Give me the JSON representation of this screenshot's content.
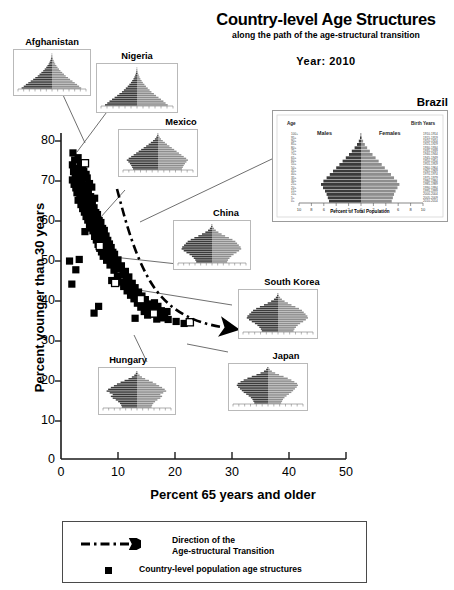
{
  "header": {
    "title": "Country-level Age Structures",
    "subtitle": "along the path of the age-structural transition",
    "year_label": "Year:  2010"
  },
  "axes": {
    "xlabel": "Percent 65 years and older",
    "ylabel": "Percent younger than 30 years",
    "xticks": [
      "0",
      "10",
      "20",
      "30",
      "40",
      "50"
    ],
    "yticks": [
      "0",
      "10",
      "20",
      "30",
      "40",
      "50",
      "60",
      "70",
      "80"
    ]
  },
  "legend": {
    "arrow_line1": "Direction of the",
    "arrow_line2": "Age-structural Transition",
    "marker_label": "Country-level population age structures"
  },
  "insets": {
    "afghanistan": {
      "caption": "Afghanistan"
    },
    "nigeria": {
      "caption": "Nigeria"
    },
    "mexico": {
      "caption": "Mexico"
    },
    "china": {
      "caption": "China"
    },
    "south_korea": {
      "caption": "South Korea"
    },
    "japan": {
      "caption": "Japan"
    },
    "hungary": {
      "caption": "Hungary"
    },
    "brazil": {
      "caption": "Brazil",
      "males_label": "Males",
      "females_label": "Females",
      "xlabel": "Percent of Total Population",
      "left_header": "Age",
      "right_header": "Birth Years"
    }
  },
  "colors": {
    "marker": "#000000",
    "highlight_marker": "#ffffff",
    "axis": "#1a1a1a",
    "inset_border": "#b9b9b9",
    "pyramid_male": "#3b3b3b",
    "pyramid_female": "#8e8e8e"
  },
  "chart_data": {
    "type": "scatter",
    "title": "Country-level Age Structures",
    "subtitle": "along the path of the age-structural transition",
    "xlabel": "Percent 65 years and older",
    "ylabel": "Percent younger than 30 years",
    "xlim": [
      0,
      50
    ],
    "ylim": [
      0,
      80
    ],
    "xticks": [
      0,
      10,
      20,
      30,
      40,
      50
    ],
    "yticks": [
      0,
      10,
      20,
      30,
      40,
      50,
      60,
      70,
      80
    ],
    "grid": false,
    "legend_position": "below-axes",
    "annotation": "Dash-dot arrow indicates direction of the age-structural transition, sweeping from high-youth/low-aged (upper left) toward low-youth/high-aged (lower right).",
    "series": [
      {
        "name": "Country-level population age structures",
        "marker": "filled-square",
        "points": [
          [
            2.1,
            77.0
          ],
          [
            2.4,
            75.2
          ],
          [
            3.0,
            75.8
          ],
          [
            2.0,
            74.0
          ],
          [
            3.4,
            74.3
          ],
          [
            2.7,
            73.2
          ],
          [
            3.8,
            73.5
          ],
          [
            2.2,
            72.3
          ],
          [
            3.1,
            72.0
          ],
          [
            4.0,
            72.4
          ],
          [
            2.5,
            71.1
          ],
          [
            3.5,
            71.3
          ],
          [
            4.4,
            71.6
          ],
          [
            2.0,
            70.2
          ],
          [
            2.9,
            70.4
          ],
          [
            3.7,
            70.0
          ],
          [
            4.6,
            70.7
          ],
          [
            2.3,
            69.1
          ],
          [
            3.2,
            69.4
          ],
          [
            4.1,
            69.0
          ],
          [
            5.0,
            69.3
          ],
          [
            2.6,
            68.2
          ],
          [
            3.6,
            68.5
          ],
          [
            4.5,
            68.1
          ],
          [
            5.4,
            68.4
          ],
          [
            2.8,
            67.0
          ],
          [
            3.9,
            67.3
          ],
          [
            4.8,
            67.0
          ],
          [
            3.3,
            66.2
          ],
          [
            4.3,
            66.5
          ],
          [
            5.2,
            66.0
          ],
          [
            3.0,
            65.1
          ],
          [
            4.0,
            65.4
          ],
          [
            5.0,
            65.2
          ],
          [
            5.9,
            65.6
          ],
          [
            3.5,
            64.0
          ],
          [
            4.5,
            64.3
          ],
          [
            5.5,
            64.1
          ],
          [
            3.8,
            63.0
          ],
          [
            4.8,
            63.4
          ],
          [
            5.8,
            63.2
          ],
          [
            4.1,
            62.1
          ],
          [
            5.1,
            62.4
          ],
          [
            6.1,
            62.0
          ],
          [
            4.4,
            61.0
          ],
          [
            5.4,
            61.3
          ],
          [
            6.4,
            61.5
          ],
          [
            4.7,
            60.1
          ],
          [
            5.7,
            60.4
          ],
          [
            6.7,
            60.0
          ],
          [
            5.0,
            59.0
          ],
          [
            6.0,
            59.3
          ],
          [
            7.0,
            59.5
          ],
          [
            5.3,
            58.1
          ],
          [
            6.3,
            58.4
          ],
          [
            7.3,
            58.0
          ],
          [
            4.2,
            57.2
          ],
          [
            5.6,
            57.4
          ],
          [
            6.6,
            57.1
          ],
          [
            7.6,
            57.5
          ],
          [
            5.9,
            56.0
          ],
          [
            6.9,
            56.3
          ],
          [
            7.9,
            56.1
          ],
          [
            6.2,
            55.1
          ],
          [
            7.2,
            55.4
          ],
          [
            8.2,
            55.0
          ],
          [
            6.5,
            54.0
          ],
          [
            7.5,
            54.3
          ],
          [
            8.5,
            54.1
          ],
          [
            6.8,
            53.0
          ],
          [
            7.8,
            53.4
          ],
          [
            8.8,
            53.2
          ],
          [
            7.1,
            52.1
          ],
          [
            8.1,
            52.4
          ],
          [
            9.1,
            52.0
          ],
          [
            7.4,
            51.0
          ],
          [
            8.4,
            51.3
          ],
          [
            9.4,
            51.5
          ],
          [
            1.5,
            49.8
          ],
          [
            3.2,
            50.2
          ],
          [
            8.0,
            50.0
          ],
          [
            9.0,
            50.3
          ],
          [
            10.0,
            50.1
          ],
          [
            2.6,
            47.6
          ],
          [
            8.6,
            48.8
          ],
          [
            9.6,
            49.0
          ],
          [
            10.6,
            48.6
          ],
          [
            9.3,
            47.5
          ],
          [
            10.3,
            47.8
          ],
          [
            11.3,
            47.2
          ],
          [
            1.9,
            44.0
          ],
          [
            9.9,
            46.0
          ],
          [
            10.9,
            46.3
          ],
          [
            11.9,
            45.8
          ],
          [
            8.9,
            44.9
          ],
          [
            10.5,
            44.5
          ],
          [
            11.5,
            44.8
          ],
          [
            12.5,
            44.2
          ],
          [
            11.0,
            43.4
          ],
          [
            12.0,
            43.7
          ],
          [
            13.0,
            43.1
          ],
          [
            11.6,
            42.3
          ],
          [
            12.6,
            42.6
          ],
          [
            13.6,
            42.0
          ],
          [
            12.2,
            41.2
          ],
          [
            13.2,
            41.5
          ],
          [
            14.2,
            41.0
          ],
          [
            12.8,
            40.3
          ],
          [
            13.8,
            40.6
          ],
          [
            14.8,
            40.1
          ],
          [
            6.6,
            38.4
          ],
          [
            13.4,
            39.2
          ],
          [
            14.4,
            39.5
          ],
          [
            15.4,
            39.0
          ],
          [
            16.4,
            39.3
          ],
          [
            14.0,
            38.2
          ],
          [
            15.0,
            38.5
          ],
          [
            16.0,
            38.1
          ],
          [
            17.0,
            38.4
          ],
          [
            5.8,
            36.7
          ],
          [
            14.6,
            37.1
          ],
          [
            15.6,
            37.4
          ],
          [
            16.6,
            37.0
          ],
          [
            17.6,
            37.3
          ],
          [
            18.6,
            37.1
          ],
          [
            15.2,
            36.2
          ],
          [
            16.2,
            36.5
          ],
          [
            17.2,
            36.0
          ],
          [
            18.2,
            36.3
          ],
          [
            13.0,
            35.4
          ],
          [
            16.8,
            35.2
          ],
          [
            17.8,
            35.5
          ],
          [
            18.8,
            35.1
          ],
          [
            20.2,
            34.6
          ],
          [
            21.6,
            34.1
          ]
        ]
      },
      {
        "name": "Highlighted countries (open squares)",
        "marker": "open-square",
        "points": [
          [
            4.2,
            74.4
          ],
          [
            6.8,
            53.6
          ],
          [
            9.5,
            44.3
          ],
          [
            14.0,
            40.2
          ],
          [
            16.3,
            36.6
          ],
          [
            22.6,
            34.4
          ]
        ],
        "labels": [
          "Afghanistan",
          "Nigeria",
          "Mexico",
          "China",
          "South Korea",
          "Japan"
        ]
      }
    ],
    "transition_arrow": {
      "description": "Dash-dot curve with arrowhead",
      "from": [
        9.8,
        62.5
      ],
      "to": [
        29.0,
        37.0
      ]
    },
    "insets": [
      {
        "country": "Afghanistan",
        "type": "population-pyramid",
        "shape": "broad-based expansive"
      },
      {
        "country": "Nigeria",
        "type": "population-pyramid",
        "shape": "broad-based expansive"
      },
      {
        "country": "Mexico",
        "type": "population-pyramid",
        "shape": "early transitional"
      },
      {
        "country": "Brazil",
        "type": "population-pyramid",
        "shape": "transitional"
      },
      {
        "country": "China",
        "type": "population-pyramid",
        "shape": "mature / constrictive"
      },
      {
        "country": "South Korea",
        "type": "population-pyramid",
        "shape": "mature / constrictive"
      },
      {
        "country": "Hungary",
        "type": "population-pyramid",
        "shape": "post-mature"
      },
      {
        "country": "Japan",
        "type": "population-pyramid",
        "shape": "post-mature / aged"
      }
    ]
  }
}
